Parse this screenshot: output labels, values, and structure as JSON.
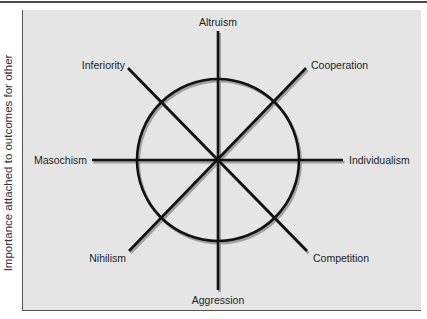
{
  "figure": {
    "y_axis_label": "Importance attached to outcomes for other",
    "center": [
      218,
      160
    ],
    "circle_radius": 81,
    "colors": {
      "line": "#111111",
      "shadow": "#9a9a9a",
      "panel_background": "#e5e5e5",
      "page_background": "#ffffff"
    },
    "orientations": [
      {
        "name": "Altruism",
        "direction": "up"
      },
      {
        "name": "Cooperation",
        "direction": "up-right"
      },
      {
        "name": "Individualism",
        "direction": "right"
      },
      {
        "name": "Competition",
        "direction": "down-right"
      },
      {
        "name": "Aggression",
        "direction": "down"
      },
      {
        "name": "Nihilism",
        "direction": "down-left"
      },
      {
        "name": "Masochism",
        "direction": "left"
      },
      {
        "name": "Inferiority",
        "direction": "up-left"
      }
    ]
  },
  "labels": {
    "altruism": "Altruism",
    "cooperation": "Cooperation",
    "individualism": "Individualism",
    "competition": "Competition",
    "aggression": "Aggression",
    "nihilism": "Nihilism",
    "masochism": "Masochism",
    "inferiority": "Inferiority"
  }
}
